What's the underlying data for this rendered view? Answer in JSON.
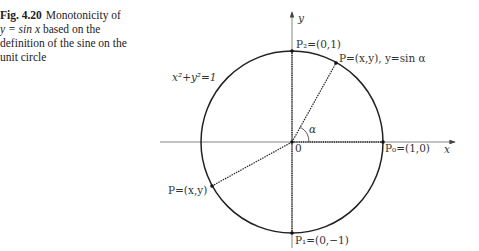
{
  "caption": {
    "figure_number": "Fig. 4.20",
    "line1_rest": "Monotonicity of",
    "line2_math": "y = sin x",
    "line2_rest": " based on the",
    "line3": "definition of the sine on the",
    "line4": "unit circle"
  },
  "diagram": {
    "axes": {
      "x_label": "x",
      "y_label": "y",
      "origin_label": "0"
    },
    "circle_equation": "x²+y²=1",
    "points": {
      "P2": "P₂=(0,1)",
      "P_upper": "P=(x,y), y=sin α",
      "P0": "P₀=(1,0)",
      "P1": "P₁=(0,−1)",
      "P_lower": "P=(x,y)"
    },
    "angle_label": "α",
    "colors": {
      "stroke": "#222222",
      "axis": "#555555"
    }
  }
}
